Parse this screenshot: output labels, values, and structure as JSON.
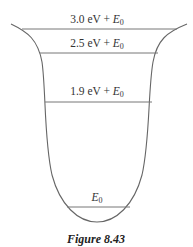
{
  "figure": {
    "caption": "Figure 8.43"
  },
  "levels": [
    {
      "value": "3.0 eV",
      "suffix_var": "E",
      "suffix_sub": "0",
      "plus": " + ",
      "y": 29
    },
    {
      "value": "2.5 eV",
      "suffix_var": "E",
      "suffix_sub": "0",
      "plus": " + ",
      "y": 53
    },
    {
      "value": "1.9 eV",
      "suffix_var": "E",
      "suffix_sub": "0",
      "plus": " + ",
      "y": 102
    },
    {
      "value": "",
      "suffix_var": "E",
      "suffix_sub": "0",
      "plus": "",
      "y": 207
    }
  ],
  "colors": {
    "line": "#666666",
    "text": "#333333"
  }
}
